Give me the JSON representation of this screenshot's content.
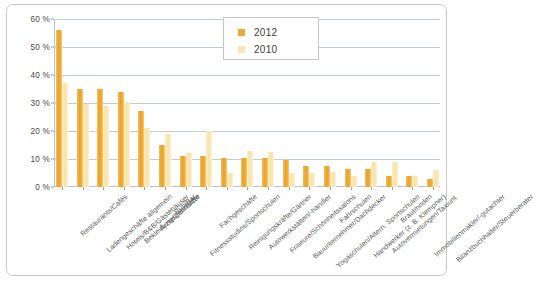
{
  "chart_data": {
    "type": "bar",
    "title": "",
    "subtitle": "",
    "xlabel": "",
    "ylabel": "",
    "ylim": [
      0,
      60
    ],
    "ytick_values": [
      0,
      10,
      20,
      30,
      40,
      50,
      60
    ],
    "ytick_labels": [
      "0 %",
      "10 %",
      "20 %",
      "30 %",
      "40 %",
      "50 %",
      "60 %"
    ],
    "grid": true,
    "legend_position": "top-right",
    "categories": [
      "Restaurants/Cafés",
      "Ladengeschäfte allgemein",
      "Hotels/B&B/Gästehäuser",
      "Bekleidungsgeschäfte",
      "Ärzte/Zahnärzte",
      "Pub/Bar",
      "Fitnessstudios/Sportschulen",
      "Fachgeschäfte",
      "Reinigungskräfte/Gärtner",
      "Autowerkstätten/-handler",
      "Friseure/Schönheitssalons",
      "Bauunternehmer/Dachdecker",
      "Yogaschulen/Altern. Sportschulen",
      "Fahrschulen",
      "Handwerker (z. B. Klempner)",
      "Autovermietungen/Taxiunt.",
      "Brautmoden",
      "Immobilienmakler/-gutachter",
      "Bilanzbuchhalter/Steuerberater"
    ],
    "series": [
      {
        "name": "2012",
        "color": "#eda32a",
        "values": [
          56,
          35,
          35,
          34,
          27,
          15,
          11,
          11,
          10.5,
          10.5,
          10.5,
          9.5,
          7.5,
          7.5,
          6.5,
          6.5,
          4,
          4,
          3
        ]
      },
      {
        "name": "2010",
        "color": "#fae3a8",
        "values": [
          37,
          29.5,
          29,
          30.5,
          21,
          19,
          12,
          20,
          5,
          13,
          12.5,
          5,
          5,
          5.5,
          4,
          9,
          9,
          4,
          6
        ]
      }
    ]
  },
  "legend": {
    "entries": [
      {
        "label": "2012",
        "swatch": "y2012"
      },
      {
        "label": "2010",
        "swatch": "y2010"
      }
    ]
  },
  "colors": {
    "series_2012": "#eda32a",
    "series_2010": "#fae3a8",
    "gridline": "#c2ccd4",
    "axis": "#b9c4cc",
    "frame_border": "#c9c9c9",
    "text": "#4a4a4a",
    "background": "#ffffff"
  }
}
